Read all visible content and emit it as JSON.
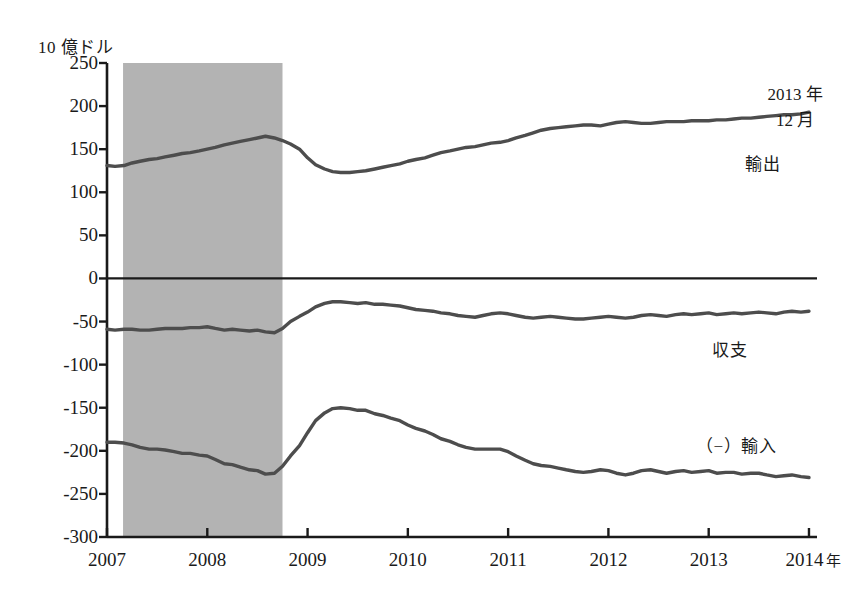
{
  "chart_data": {
    "type": "line",
    "title": "",
    "ylabel": "10 億ドル",
    "xlabel": "年",
    "ylim": [
      -300,
      250
    ],
    "xlim": [
      2007.0,
      2014.08
    ],
    "grid": false,
    "legend_position": "inline-right",
    "y_ticks": [
      250,
      200,
      150,
      100,
      50,
      0,
      -50,
      -100,
      -150,
      -200,
      -250,
      -300
    ],
    "y_tick_labels": [
      "250",
      "200",
      "150",
      "100",
      "50",
      "0",
      "-50",
      "-100",
      "-150",
      "-200",
      "-250",
      "-300"
    ],
    "x_ticks": [
      2007,
      2008,
      2009,
      2010,
      2011,
      2012,
      2013,
      2014
    ],
    "x_tick_labels": [
      "2007",
      "2008",
      "2009",
      "2010",
      "2011",
      "2012",
      "2013",
      "2014"
    ],
    "x_axis_unit_suffix": "年",
    "zero_line": 0,
    "shaded_regions": [
      {
        "name": "recession-band",
        "x_start": 2007.16,
        "x_end": 2008.75,
        "color": "#b3b3b3"
      }
    ],
    "annotations": [
      {
        "name": "latest-date-callout",
        "text_line1": "2013 年",
        "text_line2": "12 月",
        "x_px": 795,
        "y_px": 82
      }
    ],
    "series": [
      {
        "name": "輸出",
        "label": "輸出",
        "label_x_px": 745,
        "label_y_px": 150,
        "color": "#4d4d4d",
        "x": [
          2007.0,
          2007.08,
          2007.17,
          2007.25,
          2007.33,
          2007.42,
          2007.5,
          2007.58,
          2007.67,
          2007.75,
          2007.83,
          2007.92,
          2008.0,
          2008.08,
          2008.17,
          2008.25,
          2008.33,
          2008.42,
          2008.5,
          2008.58,
          2008.67,
          2008.75,
          2008.83,
          2008.92,
          2009.0,
          2009.08,
          2009.17,
          2009.25,
          2009.33,
          2009.42,
          2009.5,
          2009.58,
          2009.67,
          2009.75,
          2009.83,
          2009.92,
          2010.0,
          2010.08,
          2010.17,
          2010.25,
          2010.33,
          2010.42,
          2010.5,
          2010.58,
          2010.67,
          2010.75,
          2010.83,
          2010.92,
          2011.0,
          2011.08,
          2011.17,
          2011.25,
          2011.33,
          2011.42,
          2011.5,
          2011.58,
          2011.67,
          2011.75,
          2011.83,
          2011.92,
          2012.0,
          2012.08,
          2012.17,
          2012.25,
          2012.33,
          2012.42,
          2012.5,
          2012.58,
          2012.67,
          2012.75,
          2012.83,
          2012.92,
          2013.0,
          2013.08,
          2013.17,
          2013.25,
          2013.33,
          2013.42,
          2013.5,
          2013.58,
          2013.67,
          2013.75,
          2013.83,
          2013.92,
          2014.0
        ],
        "values": [
          131,
          130,
          131,
          134,
          136,
          138,
          139,
          141,
          143,
          145,
          146,
          148,
          150,
          152,
          155,
          157,
          159,
          161,
          163,
          165,
          163,
          160,
          156,
          150,
          140,
          132,
          127,
          124,
          123,
          123,
          124,
          125,
          127,
          129,
          131,
          133,
          136,
          138,
          140,
          143,
          146,
          148,
          150,
          152,
          153,
          155,
          157,
          158,
          160,
          163,
          166,
          169,
          172,
          174,
          175,
          176,
          177,
          178,
          178,
          177,
          179,
          181,
          182,
          181,
          180,
          180,
          181,
          182,
          182,
          182,
          183,
          183,
          183,
          184,
          184,
          185,
          186,
          186,
          187,
          188,
          189,
          190,
          190,
          191,
          193
        ]
      },
      {
        "name": "収支",
        "label": "収支",
        "label_x_px": 712,
        "label_y_px": 336,
        "color": "#4d4d4d",
        "x": [
          2007.0,
          2007.08,
          2007.17,
          2007.25,
          2007.33,
          2007.42,
          2007.5,
          2007.58,
          2007.67,
          2007.75,
          2007.83,
          2007.92,
          2008.0,
          2008.08,
          2008.17,
          2008.25,
          2008.33,
          2008.42,
          2008.5,
          2008.58,
          2008.67,
          2008.75,
          2008.83,
          2008.92,
          2009.0,
          2009.08,
          2009.17,
          2009.25,
          2009.33,
          2009.42,
          2009.5,
          2009.58,
          2009.67,
          2009.75,
          2009.83,
          2009.92,
          2010.0,
          2010.08,
          2010.17,
          2010.25,
          2010.33,
          2010.42,
          2010.5,
          2010.58,
          2010.67,
          2010.75,
          2010.83,
          2010.92,
          2011.0,
          2011.08,
          2011.17,
          2011.25,
          2011.33,
          2011.42,
          2011.5,
          2011.58,
          2011.67,
          2011.75,
          2011.83,
          2011.92,
          2012.0,
          2012.08,
          2012.17,
          2012.25,
          2012.33,
          2012.42,
          2012.5,
          2012.58,
          2012.67,
          2012.75,
          2012.83,
          2012.92,
          2013.0,
          2013.08,
          2013.17,
          2013.25,
          2013.33,
          2013.42,
          2013.5,
          2013.58,
          2013.67,
          2013.75,
          2013.83,
          2013.92,
          2014.0
        ],
        "values": [
          -59,
          -60,
          -59,
          -59,
          -60,
          -60,
          -59,
          -58,
          -58,
          -58,
          -57,
          -57,
          -56,
          -58,
          -60,
          -59,
          -60,
          -61,
          -60,
          -62,
          -63,
          -58,
          -50,
          -44,
          -39,
          -33,
          -29,
          -27,
          -27,
          -28,
          -29,
          -28,
          -30,
          -30,
          -31,
          -32,
          -34,
          -36,
          -37,
          -38,
          -40,
          -41,
          -43,
          -44,
          -45,
          -43,
          -41,
          -40,
          -41,
          -43,
          -45,
          -46,
          -45,
          -44,
          -45,
          -46,
          -47,
          -47,
          -46,
          -45,
          -44,
          -45,
          -46,
          -45,
          -43,
          -42,
          -43,
          -44,
          -42,
          -41,
          -42,
          -41,
          -40,
          -42,
          -41,
          -40,
          -41,
          -40,
          -39,
          -40,
          -41,
          -39,
          -38,
          -39,
          -38
        ]
      },
      {
        "name": "（−）輸入",
        "label": "（−）輸入",
        "label_x_px": 696,
        "label_y_px": 432,
        "color": "#4d4d4d",
        "x": [
          2007.0,
          2007.08,
          2007.17,
          2007.25,
          2007.33,
          2007.42,
          2007.5,
          2007.58,
          2007.67,
          2007.75,
          2007.83,
          2007.92,
          2008.0,
          2008.08,
          2008.17,
          2008.25,
          2008.33,
          2008.42,
          2008.5,
          2008.58,
          2008.67,
          2008.75,
          2008.83,
          2008.92,
          2009.0,
          2009.08,
          2009.17,
          2009.25,
          2009.33,
          2009.42,
          2009.5,
          2009.58,
          2009.67,
          2009.75,
          2009.83,
          2009.92,
          2010.0,
          2010.08,
          2010.17,
          2010.25,
          2010.33,
          2010.42,
          2010.5,
          2010.58,
          2010.67,
          2010.75,
          2010.83,
          2010.92,
          2011.0,
          2011.08,
          2011.17,
          2011.25,
          2011.33,
          2011.42,
          2011.5,
          2011.58,
          2011.67,
          2011.75,
          2011.83,
          2011.92,
          2012.0,
          2012.08,
          2012.17,
          2012.25,
          2012.33,
          2012.42,
          2012.5,
          2012.58,
          2012.67,
          2012.75,
          2012.83,
          2012.92,
          2013.0,
          2013.08,
          2013.17,
          2013.25,
          2013.33,
          2013.42,
          2013.5,
          2013.58,
          2013.67,
          2013.75,
          2013.83,
          2013.92,
          2014.0
        ],
        "values": [
          -190,
          -190,
          -191,
          -193,
          -196,
          -198,
          -198,
          -199,
          -201,
          -203,
          -203,
          -205,
          -206,
          -210,
          -215,
          -216,
          -219,
          -222,
          -223,
          -227,
          -226,
          -218,
          -206,
          -194,
          -179,
          -165,
          -156,
          -151,
          -150,
          -151,
          -153,
          -153,
          -157,
          -159,
          -162,
          -165,
          -170,
          -174,
          -177,
          -181,
          -186,
          -189,
          -193,
          -196,
          -198,
          -198,
          -198,
          -198,
          -201,
          -206,
          -211,
          -215,
          -217,
          -218,
          -220,
          -222,
          -224,
          -225,
          -224,
          -222,
          -223,
          -226,
          -228,
          -226,
          -223,
          -222,
          -224,
          -226,
          -224,
          -223,
          -225,
          -224,
          -223,
          -226,
          -225,
          -225,
          -227,
          -226,
          -226,
          -228,
          -230,
          -229,
          -228,
          -230,
          -231
        ]
      }
    ]
  }
}
